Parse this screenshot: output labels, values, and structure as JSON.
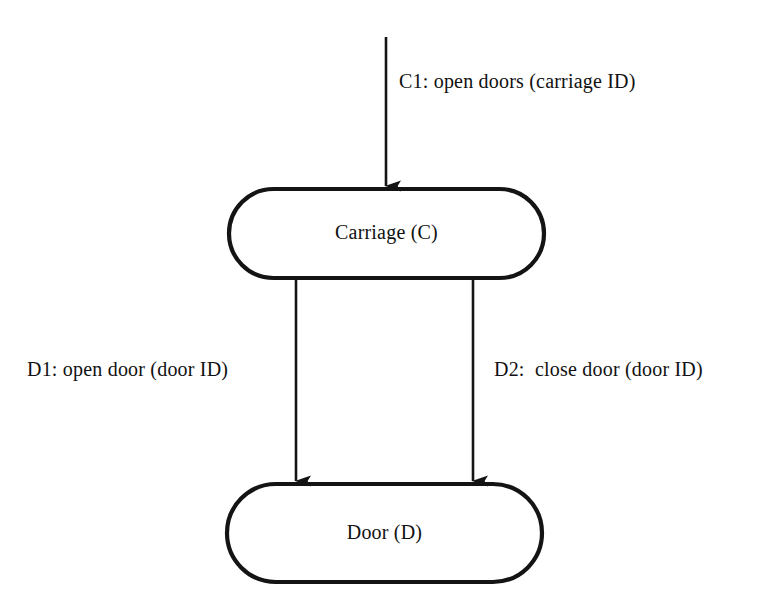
{
  "diagram": {
    "background_color": "#ffffff",
    "stroke_color": "#141414",
    "nodes": [
      {
        "id": "carriage",
        "label": "Carriage (C)",
        "shape": "stadium"
      },
      {
        "id": "door",
        "label": "Door (D)",
        "shape": "stadium"
      }
    ],
    "edges": [
      {
        "id": "c1",
        "label": "C1: open doors (carriage ID)",
        "from": "external",
        "to": "carriage",
        "direction": "down"
      },
      {
        "id": "d1",
        "label": "D1: open door (door ID)",
        "from": "carriage",
        "to": "door",
        "direction": "down"
      },
      {
        "id": "d2",
        "label": "D2:  close door (door ID)",
        "from": "carriage",
        "to": "door",
        "direction": "down"
      }
    ]
  }
}
